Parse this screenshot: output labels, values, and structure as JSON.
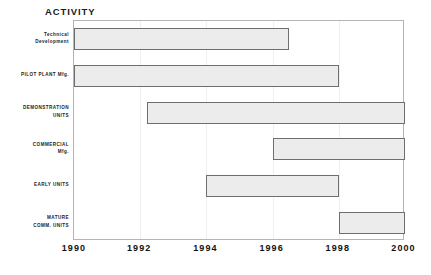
{
  "chart": {
    "title": "ACTIVITY"
  },
  "chart_data": {
    "type": "bar",
    "subtype": "gantt",
    "title": "ACTIVITY",
    "xlabel": "",
    "ylabel": "",
    "xlim": [
      1990,
      2000
    ],
    "xticks": [
      1990,
      1992,
      1994,
      1996,
      1998,
      2000
    ],
    "xtick_labels": [
      "1990",
      "1992",
      "1994",
      "1996",
      "1998",
      "2000"
    ],
    "grid": false,
    "legend": "none",
    "bar_fill_color": "#ececec",
    "bar_border_color": "#6e6e6e",
    "frame_color": "#b4b4b4",
    "background_color": "#ffffff",
    "categories": [
      "Technical Development",
      "PILOT PLANT Mfg.",
      "DEMONSTRATION UNITS",
      "COMMERCIAL Mfg.",
      "EARLY UNITS",
      "MATURE COMM. UNITS"
    ],
    "tasks": [
      {
        "label_lines": [
          "Technical",
          "Development"
        ],
        "name": "Technical Development",
        "start": 1990,
        "end": 1996.5,
        "duration": 6.5
      },
      {
        "label_lines": [
          "PILOT PLANT Mfg."
        ],
        "name": "PILOT PLANT Mfg.",
        "start": 1990,
        "end": 1998,
        "duration": 8
      },
      {
        "label_lines": [
          "DEMONSTRATION",
          "UNITS"
        ],
        "name": "DEMONSTRATION UNITS",
        "start": 1992.2,
        "end": 2000,
        "duration": 7.8
      },
      {
        "label_lines": [
          "COMMERCIAL",
          "Mfg."
        ],
        "name": "COMMERCIAL Mfg.",
        "start": 1996,
        "end": 2000,
        "duration": 4
      },
      {
        "label_lines": [
          "EARLY UNITS"
        ],
        "name": "EARLY UNITS",
        "start": 1994,
        "end": 1998,
        "duration": 4
      },
      {
        "label_lines": [
          "MATURE",
          "COMM. UNITS"
        ],
        "name": "MATURE COMM. UNITS",
        "start": 1998,
        "end": 2000,
        "duration": 2
      }
    ]
  }
}
